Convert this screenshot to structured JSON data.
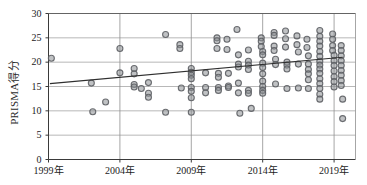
{
  "chart_data": {
    "type": "scatter",
    "title": "",
    "xlabel": "",
    "ylabel": "PRISMA得分",
    "xlim": [
      1999,
      2020.5
    ],
    "ylim": [
      0,
      30
    ],
    "grid": true,
    "legend": null,
    "xticks": [
      {
        "value": 1999,
        "label": "1999年"
      },
      {
        "value": 2004,
        "label": "2004年"
      },
      {
        "value": 2009,
        "label": "2009年"
      },
      {
        "value": 2014,
        "label": "2014年"
      },
      {
        "value": 2019,
        "label": "2019年"
      }
    ],
    "yticks": [
      {
        "value": 0,
        "label": "0"
      },
      {
        "value": 5,
        "label": "5"
      },
      {
        "value": 10,
        "label": "10"
      },
      {
        "value": 15,
        "label": "15"
      },
      {
        "value": 20,
        "label": "20"
      },
      {
        "value": 25,
        "label": "25"
      },
      {
        "value": 30,
        "label": "30"
      }
    ],
    "marker": {
      "shape": "circle",
      "fill": "#8d8f94",
      "stroke": "#5c5e63",
      "radius": 3.0,
      "opacity": 0.85
    },
    "trendline": {
      "color": "#2f2f2f",
      "width": 1.1,
      "x_start": 1999.1,
      "y_start": 15.6,
      "x_end": 2019.6,
      "y_end": 21.0
    },
    "points": [
      [
        1999.2,
        20.8
      ],
      [
        2002.0,
        15.7
      ],
      [
        2002.1,
        9.8
      ],
      [
        2003.0,
        11.8
      ],
      [
        2004.0,
        22.8
      ],
      [
        2004.0,
        17.8
      ],
      [
        2005.0,
        18.7
      ],
      [
        2005.0,
        17.6
      ],
      [
        2005.0,
        15.4
      ],
      [
        2005.0,
        14.9
      ],
      [
        2005.5,
        14.6
      ],
      [
        2006.0,
        15.8
      ],
      [
        2006.0,
        13.6
      ],
      [
        2006.0,
        12.8
      ],
      [
        2007.2,
        25.7
      ],
      [
        2007.2,
        9.7
      ],
      [
        2008.2,
        23.6
      ],
      [
        2008.2,
        22.8
      ],
      [
        2008.3,
        14.7
      ],
      [
        2009.0,
        18.7
      ],
      [
        2009.0,
        17.9
      ],
      [
        2009.0,
        17.3
      ],
      [
        2009.0,
        16.6
      ],
      [
        2009.0,
        14.8
      ],
      [
        2009.0,
        14.0
      ],
      [
        2009.0,
        12.7
      ],
      [
        2009.0,
        9.7
      ],
      [
        2010.0,
        17.8
      ],
      [
        2010.0,
        14.8
      ],
      [
        2010.0,
        13.7
      ],
      [
        2010.8,
        25.0
      ],
      [
        2010.8,
        24.4
      ],
      [
        2010.8,
        22.8
      ],
      [
        2010.9,
        17.7
      ],
      [
        2010.9,
        16.9
      ],
      [
        2010.9,
        14.8
      ],
      [
        2010.9,
        14.2
      ],
      [
        2011.5,
        24.7
      ],
      [
        2011.5,
        22.6
      ],
      [
        2011.6,
        17.7
      ],
      [
        2011.6,
        15.1
      ],
      [
        2011.6,
        14.8
      ],
      [
        2012.2,
        26.7
      ],
      [
        2012.3,
        21.5
      ],
      [
        2012.3,
        19.6
      ],
      [
        2012.3,
        19.0
      ],
      [
        2012.3,
        15.7
      ],
      [
        2012.3,
        13.7
      ],
      [
        2012.4,
        9.5
      ],
      [
        2013.0,
        22.5
      ],
      [
        2013.0,
        20.2
      ],
      [
        2013.0,
        19.4
      ],
      [
        2013.0,
        18.5
      ],
      [
        2013.0,
        14.2
      ],
      [
        2013.0,
        13.6
      ],
      [
        2013.2,
        10.5
      ],
      [
        2013.9,
        25.0
      ],
      [
        2013.9,
        24.3
      ],
      [
        2013.9,
        23.2
      ],
      [
        2014.0,
        22.2
      ],
      [
        2014.0,
        21.5
      ],
      [
        2014.0,
        19.8
      ],
      [
        2014.0,
        18.9
      ],
      [
        2014.0,
        17.6
      ],
      [
        2014.0,
        16.1
      ],
      [
        2014.0,
        15.0
      ],
      [
        2014.0,
        14.2
      ],
      [
        2014.0,
        13.6
      ],
      [
        2014.8,
        26.1
      ],
      [
        2014.8,
        25.5
      ],
      [
        2014.8,
        23.3
      ],
      [
        2014.8,
        22.4
      ],
      [
        2014.9,
        20.6
      ],
      [
        2014.9,
        19.5
      ],
      [
        2014.9,
        15.5
      ],
      [
        2015.6,
        26.4
      ],
      [
        2015.6,
        24.8
      ],
      [
        2015.6,
        23.1
      ],
      [
        2015.7,
        20.0
      ],
      [
        2015.7,
        19.4
      ],
      [
        2015.7,
        18.6
      ],
      [
        2015.7,
        14.6
      ],
      [
        2016.4,
        25.4
      ],
      [
        2016.4,
        23.6
      ],
      [
        2016.5,
        22.1
      ],
      [
        2016.5,
        19.6
      ],
      [
        2016.5,
        14.7
      ],
      [
        2017.1,
        24.7
      ],
      [
        2017.1,
        23.0
      ],
      [
        2017.2,
        21.3
      ],
      [
        2017.2,
        19.6
      ],
      [
        2017.2,
        18.5
      ],
      [
        2017.2,
        17.6
      ],
      [
        2017.2,
        16.4
      ],
      [
        2017.2,
        14.6
      ],
      [
        2018.0,
        26.5
      ],
      [
        2018.0,
        25.3
      ],
      [
        2018.0,
        24.3
      ],
      [
        2018.0,
        23.3
      ],
      [
        2018.0,
        22.2
      ],
      [
        2018.0,
        21.2
      ],
      [
        2018.0,
        20.2
      ],
      [
        2018.0,
        19.4
      ],
      [
        2018.0,
        18.6
      ],
      [
        2018.0,
        17.7
      ],
      [
        2018.0,
        16.6
      ],
      [
        2018.0,
        15.6
      ],
      [
        2018.0,
        14.6
      ],
      [
        2018.0,
        13.4
      ],
      [
        2018.0,
        12.4
      ],
      [
        2018.9,
        25.8
      ],
      [
        2018.9,
        24.7
      ],
      [
        2018.9,
        23.4
      ],
      [
        2018.9,
        22.4
      ],
      [
        2019.0,
        21.4
      ],
      [
        2019.0,
        20.3
      ],
      [
        2019.0,
        19.3
      ],
      [
        2019.0,
        18.2
      ],
      [
        2019.0,
        17.0
      ],
      [
        2019.0,
        16.0
      ],
      [
        2019.0,
        14.9
      ],
      [
        2019.5,
        23.4
      ],
      [
        2019.5,
        22.4
      ],
      [
        2019.5,
        21.3
      ],
      [
        2019.5,
        20.3
      ],
      [
        2019.5,
        19.3
      ],
      [
        2019.5,
        18.3
      ],
      [
        2019.5,
        17.3
      ],
      [
        2019.5,
        16.2
      ],
      [
        2019.5,
        15.2
      ],
      [
        2019.6,
        12.4
      ],
      [
        2019.6,
        8.4
      ]
    ]
  }
}
